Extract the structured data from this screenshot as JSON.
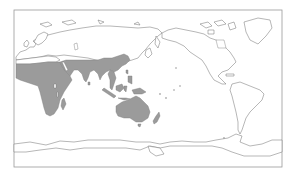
{
  "map": {
    "projection": "pacific-centered equirectangular world map",
    "legend": null,
    "colors": {
      "background": "#ffffff",
      "land_outline": "#6e6e6e",
      "range_fill": "#9b9b9b",
      "frame": "#9a9a9a"
    },
    "range_regions": [
      "Sub-Saharan Africa",
      "Arabian Peninsula",
      "Middle East",
      "South Asia",
      "Southeast Asia",
      "Southern China",
      "Maritime Southeast Asia",
      "New Guinea",
      "Australia",
      "New Zealand"
    ],
    "unshaded_regions": [
      "Europe",
      "Northern Asia",
      "North America",
      "South America",
      "Antarctica",
      "Greenland"
    ]
  }
}
